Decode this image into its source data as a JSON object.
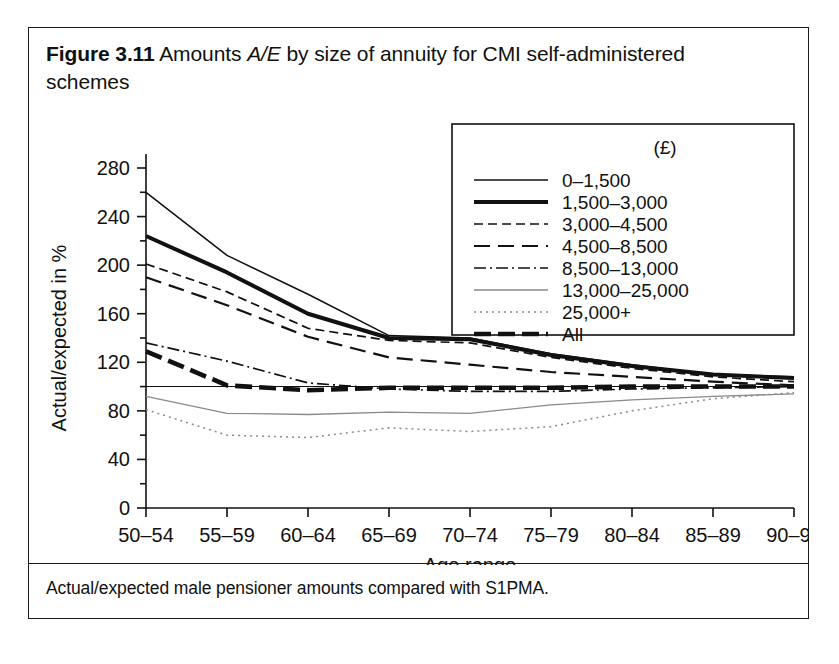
{
  "figure": {
    "number": "Figure 3.11",
    "title_rest": " Amounts A/E by size of annuity for CMI self-administered schemes",
    "title_part_a": "Amounts ",
    "title_italic_1": "A",
    "title_slash": "/",
    "title_italic_2": "E",
    "title_part_b": " by size of annuity for CMI self-administered schemes",
    "footnote": "Actual/expected male pensioner amounts compared with S1PMA."
  },
  "chart_data": {
    "type": "line",
    "title": "Figure 3.11 Amounts A/E by size of annuity for CMI self-administered schemes",
    "xlabel": "Age range",
    "ylabel": "Actual/expected in %",
    "categories": [
      "50–54",
      "55–59",
      "60–64",
      "65–69",
      "70–74",
      "75–79",
      "80–84",
      "85–89",
      "90–94"
    ],
    "ylim": [
      0,
      280
    ],
    "yticks": [
      0,
      40,
      80,
      120,
      160,
      200,
      240,
      280
    ],
    "grid": false,
    "reference_line": 100,
    "legend_position": "top-right",
    "legend_title": "(£)",
    "series": [
      {
        "name": "0–1,500",
        "style": "thin-solid",
        "values": [
          260,
          208,
          176,
          142,
          140,
          127,
          118,
          110,
          108
        ]
      },
      {
        "name": "1,500–3,000",
        "style": "thick-solid",
        "values": [
          224,
          194,
          160,
          140,
          139,
          126,
          117,
          110,
          107
        ]
      },
      {
        "name": "3,000–4,500",
        "style": "short-dash",
        "values": [
          201,
          178,
          148,
          138,
          136,
          124,
          115,
          108,
          104
        ]
      },
      {
        "name": "4,500–8,500",
        "style": "long-dash",
        "values": [
          190,
          167,
          141,
          124,
          118,
          112,
          108,
          104,
          101
        ]
      },
      {
        "name": "8,500–13,000",
        "style": "dash-dot",
        "values": [
          136,
          121,
          103,
          98,
          96,
          96,
          98,
          99,
          100
        ]
      },
      {
        "name": "13,000–25,000",
        "style": "thin-light",
        "values": [
          92,
          78,
          77,
          79,
          78,
          85,
          89,
          92,
          94
        ]
      },
      {
        "name": "25,000+",
        "style": "dotted",
        "values": [
          81,
          60,
          58,
          66,
          63,
          67,
          80,
          90,
          95
        ]
      },
      {
        "name": "All",
        "style": "thick-dash",
        "values": [
          129,
          101,
          97,
          99,
          99,
          99,
          100,
          100,
          100
        ]
      }
    ]
  },
  "axes": {
    "y_tick_labels": [
      "280",
      "240",
      "200",
      "160",
      "120",
      "80",
      "40",
      "0"
    ],
    "x_tick_labels": [
      "50–54",
      "55–59",
      "60–64",
      "65–69",
      "70–74",
      "75–79",
      "80–84",
      "85–89",
      "90–94"
    ],
    "y_axis_title": "Actual/expected in %",
    "x_axis_title": "Age range"
  },
  "legend": {
    "header": "(£)",
    "items": [
      {
        "label": "0–1,500"
      },
      {
        "label": "1,500–3,000"
      },
      {
        "label": "3,000–4,500"
      },
      {
        "label": "4,500–8,500"
      },
      {
        "label": "8,500–13,000"
      },
      {
        "label": "13,000–25,000"
      },
      {
        "label": "25,000+"
      },
      {
        "label": "All"
      }
    ]
  },
  "colors": {
    "ink": "#111111",
    "frame": "#1b1b1b",
    "light": "#8a8a8a",
    "background": "#ffffff"
  }
}
